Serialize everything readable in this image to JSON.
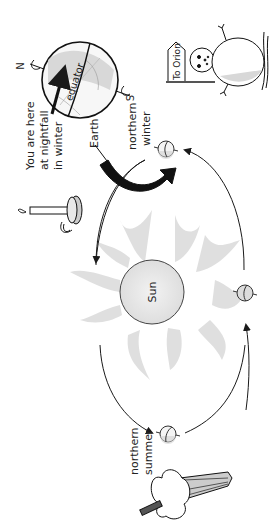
{
  "diagram": {
    "labels": {
      "you_are_here": [
        "You are here",
        "at nightfall",
        "in winter"
      ],
      "earth": "Earth",
      "northern_winter": [
        "northern",
        "winter"
      ],
      "northern_summer": [
        "northern",
        "summer"
      ],
      "sun": "Sun",
      "equator": "equator",
      "north": "N",
      "south": "S",
      "sign": "To Orion"
    },
    "colors": {
      "stroke": "#1a1a1a",
      "sun_fill": "#e6e6e6",
      "ray_fill": "#d9d9d9",
      "globe_shade": "#cfcfcf",
      "background": "#ffffff"
    },
    "orientation": "rotated 90° counter-clockwise"
  }
}
